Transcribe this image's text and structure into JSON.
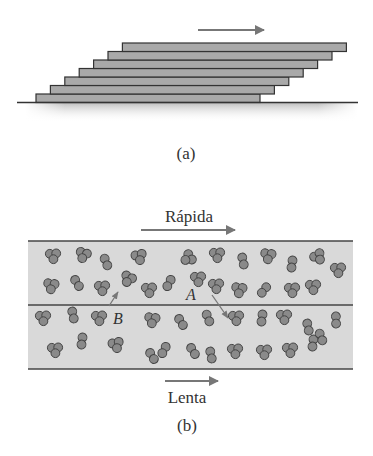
{
  "figure": {
    "panel_a": {
      "caption": "(a)",
      "motion_arrow": "right-arrow",
      "plates": {
        "count": 7,
        "bottom_x": 36,
        "bottom_width": 224,
        "top_y_bottom_plate": 94,
        "height": 8.5,
        "shift_x": 14.4,
        "fill": "#a9a9a9",
        "stroke": "#333333"
      }
    },
    "panel_b": {
      "caption": "(b)",
      "top_label": "Rápida",
      "bottom_label": "Lenta",
      "point_a_label": "A",
      "point_b_label": "B",
      "band_fill": "#d9d9d9",
      "molecule_fill": "#8a8a8a",
      "line_color": "#444444"
    }
  }
}
